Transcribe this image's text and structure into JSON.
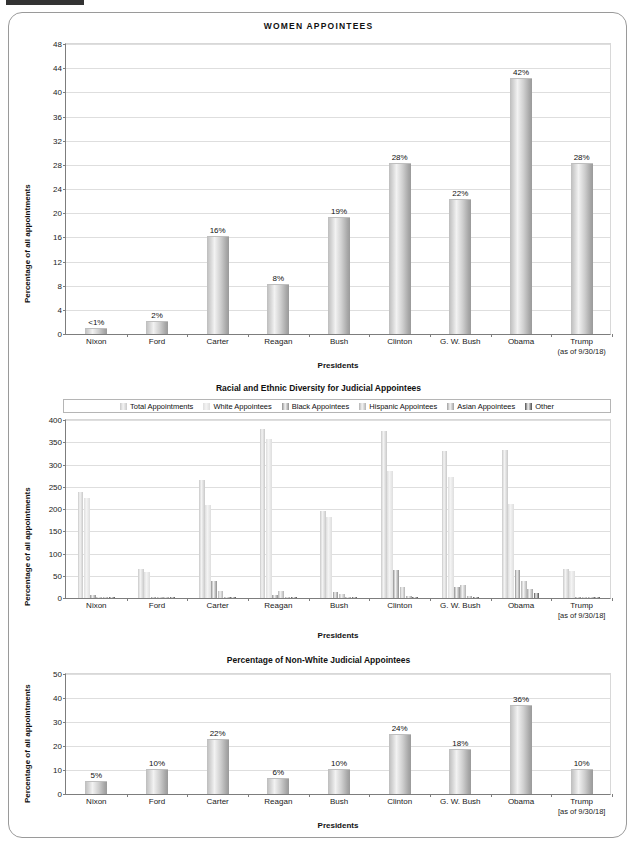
{
  "document": {
    "presidents": [
      "Nixon",
      "Ford",
      "Carter",
      "Reagan",
      "Bush",
      "Clinton",
      "G. W. Bush",
      "Obama",
      "Trump"
    ],
    "trump_note": "(as of 9/30/18)",
    "trump_note_bracket": "[as of 9/30/18]"
  },
  "chart_data": [
    {
      "id": "women-appointees",
      "type": "bar",
      "title": "WOMEN  APPOINTEES",
      "xlabel": "Presidents",
      "ylabel": "Percentage of all appointments",
      "categories": [
        "Nixon",
        "Ford",
        "Carter",
        "Reagan",
        "Bush",
        "Clinton",
        "G. W. Bush",
        "Obama",
        "Trump"
      ],
      "values": [
        0.8,
        2,
        16,
        8,
        19,
        28,
        22,
        42,
        28
      ],
      "labels": [
        "<1%",
        "2%",
        "16%",
        "8%",
        "19%",
        "28%",
        "22%",
        "42%",
        "28%"
      ],
      "ylim": [
        0,
        48
      ],
      "yticks": [
        0,
        4,
        8,
        12,
        16,
        20,
        24,
        28,
        32,
        36,
        40,
        44,
        48
      ],
      "grid": true,
      "legend": "none"
    },
    {
      "id": "racial-ethnic-diversity",
      "type": "bar",
      "title": "Racial and Ethnic Diversity for Judicial Appointees",
      "xlabel": "Presidents",
      "ylabel": "Percentage of all appointments",
      "categories": [
        "Nixon",
        "Ford",
        "Carter",
        "Reagan",
        "Bush",
        "Clinton",
        "G. W. Bush",
        "Obama",
        "Trump"
      ],
      "ylim": [
        0,
        400
      ],
      "yticks": [
        0,
        50,
        100,
        150,
        200,
        250,
        300,
        350,
        400
      ],
      "grid": true,
      "legend": "top",
      "series": [
        {
          "name": "Total Appointments",
          "color": "#c9c9c9",
          "values": [
            235,
            64,
            262,
            376,
            193,
            372,
            327,
            329,
            65
          ]
        },
        {
          "name": "White Appointees",
          "color": "#dedede",
          "values": [
            222,
            58,
            206,
            354,
            180,
            283,
            268,
            209,
            59
          ]
        },
        {
          "name": "Black Appointees",
          "color": "#8f8f8f",
          "values": [
            6,
            3,
            37,
            7,
            13,
            62,
            24,
            62,
            1
          ]
        },
        {
          "name": "Hispanic Appointees",
          "color": "#b2b2b2",
          "values": [
            2,
            1,
            16,
            15,
            8,
            25,
            30,
            37,
            2
          ]
        },
        {
          "name": "Asian Appointees",
          "color": "#a0a0a0",
          "values": [
            1,
            0,
            2,
            2,
            0,
            5,
            4,
            20,
            3
          ]
        },
        {
          "name": "Other",
          "color": "#4d4d4d",
          "values": [
            1,
            0,
            1,
            1,
            0,
            3,
            2,
            12,
            0
          ]
        }
      ]
    },
    {
      "id": "percentage-non-white",
      "type": "bar",
      "title": "Percentage of Non-White Judicial Appointees",
      "xlabel": "Presidents",
      "ylabel": "Percentage of all appointments",
      "categories": [
        "Nixon",
        "Ford",
        "Carter",
        "Reagan",
        "Bush",
        "Clinton",
        "G. W. Bush",
        "Obama",
        "Trump"
      ],
      "values": [
        5,
        10,
        22,
        6,
        10,
        24,
        18,
        36,
        10
      ],
      "labels": [
        "5%",
        "10%",
        "22%",
        "6%",
        "10%",
        "24%",
        "18%",
        "36%",
        "10%"
      ],
      "ylim": [
        0,
        50
      ],
      "yticks": [
        0,
        10,
        20,
        30,
        40,
        50
      ],
      "grid": true,
      "legend": "none"
    }
  ],
  "colors": {
    "frame_border": "#9a9a9a",
    "gridline": "#dedede",
    "axis": "#7d7d7d",
    "text": "#1a1a1a"
  }
}
